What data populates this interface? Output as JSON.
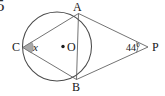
{
  "figure": {
    "kind": "circle-geometry-diagram",
    "question_number": "5",
    "background_color": "#ffffff",
    "stroke_color": "#444444",
    "text_color": "#161616",
    "labels": {
      "point_a": "A",
      "point_b": "B",
      "point_c": "C",
      "center_o": "O",
      "point_p": "P",
      "unknown_angle": "x",
      "given_angle": "44°"
    },
    "geometry": {
      "circle": {
        "cx": 57,
        "cy": 46.5,
        "r": 34.5
      },
      "center_dot": {
        "cx": 63,
        "cy": 46.5,
        "r": 1.6
      },
      "points": {
        "A": {
          "x": 78.5,
          "y": 13.5
        },
        "B": {
          "x": 76.5,
          "y": 79.5
        },
        "C": {
          "x": 22.8,
          "y": 47.5
        },
        "P": {
          "x": 148,
          "y": 47
        }
      },
      "segments": [
        {
          "name": "chord-ca",
          "from": "C",
          "to": "A"
        },
        {
          "name": "chord-cb",
          "from": "C",
          "to": "B"
        },
        {
          "name": "chord-ab",
          "from": "A",
          "to": "B"
        },
        {
          "name": "tangent-ap",
          "from": "A",
          "to": "P"
        },
        {
          "name": "tangent-bp",
          "from": "B",
          "to": "P"
        }
      ],
      "angle_marker_c": {
        "filled": true,
        "radius": 9
      },
      "angle_marker_p": {
        "filled": false,
        "radius": 11
      }
    }
  }
}
